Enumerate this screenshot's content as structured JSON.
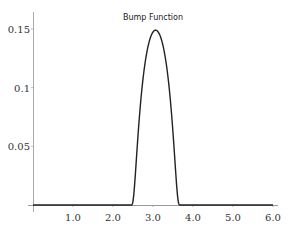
{
  "chart_data": {
    "type": "line",
    "title": "Bump Function",
    "xlabel": "",
    "ylabel": "",
    "xlim": [
      0,
      6.0
    ],
    "ylim": [
      0,
      0.16
    ],
    "grid": false,
    "legend": null,
    "x_ticks": [
      "1.0",
      "2.0",
      "3.0",
      "4.0",
      "5.0",
      "6.0"
    ],
    "x_tick_values": [
      1,
      2,
      3,
      4,
      5,
      6
    ],
    "y_ticks": [
      "0.05",
      "0.1",
      "0.15"
    ],
    "y_tick_values": [
      0.05,
      0.1,
      0.15
    ],
    "series": [
      {
        "name": "bump",
        "color": "#222222",
        "x": [
          0,
          0.5,
          1.0,
          1.5,
          2.0,
          2.4,
          2.45,
          2.5,
          2.6,
          2.7,
          2.8,
          2.9,
          3.0,
          3.07,
          3.15,
          3.25,
          3.35,
          3.45,
          3.55,
          3.62,
          3.7,
          4.0,
          4.5,
          5.0,
          5.5,
          6.0
        ],
        "y": [
          0,
          0,
          0,
          0,
          0,
          0,
          0.002,
          0.008,
          0.03,
          0.062,
          0.098,
          0.128,
          0.145,
          0.149,
          0.145,
          0.125,
          0.09,
          0.05,
          0.018,
          0.005,
          0,
          0,
          0,
          0,
          0,
          0
        ]
      }
    ]
  }
}
